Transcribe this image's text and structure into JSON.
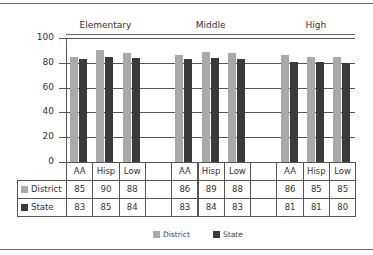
{
  "chart_data": {
    "type": "bar",
    "title": "",
    "groups": [
      "Elementary",
      "Middle",
      "High"
    ],
    "categories": [
      "AA",
      "Hisp",
      "Low",
      "AA",
      "Hisp",
      "Low",
      "AA",
      "Hisp",
      "Low"
    ],
    "series": [
      {
        "name": "District",
        "color": "#a9a9a9",
        "values": [
          85,
          90,
          88,
          86,
          89,
          88,
          86,
          85,
          85
        ]
      },
      {
        "name": "State",
        "color": "#3a3a3a",
        "values": [
          83,
          85,
          84,
          83,
          84,
          83,
          81,
          81,
          80
        ]
      }
    ],
    "xlabel": "",
    "ylabel": "",
    "ylim": [
      0,
      100
    ],
    "yticks": [
      0,
      20,
      40,
      60,
      80,
      100
    ],
    "grid": true,
    "legend_position": "bottom",
    "data_table": true
  },
  "labels": {
    "groups": [
      "Elementary",
      "Middle",
      "High"
    ],
    "yticks": [
      "100",
      "80",
      "60",
      "40",
      "20",
      "0"
    ],
    "columns": [
      "AA",
      "Hisp",
      "Low",
      "",
      "AA",
      "Hisp",
      "Low",
      "",
      "AA",
      "Hisp",
      "Low"
    ],
    "rows": [
      {
        "name": "District",
        "values": [
          "85",
          "90",
          "88",
          "",
          "86",
          "89",
          "88",
          "",
          "86",
          "85",
          "85"
        ]
      },
      {
        "name": "State",
        "values": [
          "83",
          "85",
          "84",
          "",
          "83",
          "84",
          "83",
          "",
          "81",
          "81",
          "80"
        ]
      }
    ],
    "legend": [
      "District",
      "State"
    ]
  }
}
